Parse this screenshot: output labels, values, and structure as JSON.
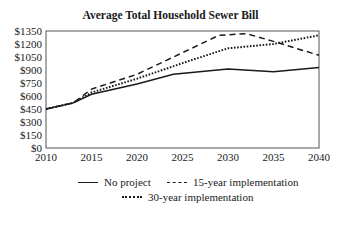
{
  "chart_data": {
    "type": "line",
    "title": "Average  Total Household Sewer Bill",
    "xlabel": "",
    "ylabel": "",
    "x_ticks": [
      "2010",
      "2015",
      "2020",
      "2025",
      "2030",
      "2035",
      "2040"
    ],
    "y_ticks": [
      "$0",
      "$150",
      "$300",
      "$450",
      "$600",
      "$750",
      "$900",
      "$1050",
      "$1200",
      "$1350"
    ],
    "xlim": [
      2010,
      2040
    ],
    "ylim": [
      0,
      1350
    ],
    "grid": false,
    "legend_position": "bottom",
    "series": [
      {
        "name": "No project",
        "style": "solid",
        "x": [
          2010,
          2013,
          2015,
          2020,
          2024,
          2030,
          2035,
          2040
        ],
        "values": [
          450,
          520,
          620,
          740,
          850,
          910,
          880,
          930
        ]
      },
      {
        "name": "15-year implementation",
        "style": "dashed",
        "x": [
          2010,
          2013,
          2015,
          2020,
          2025,
          2029,
          2032,
          2035,
          2040
        ],
        "values": [
          450,
          520,
          680,
          850,
          1100,
          1300,
          1320,
          1230,
          1070
        ]
      },
      {
        "name": "30-year implementation",
        "style": "dotted",
        "x": [
          2010,
          2013,
          2015,
          2020,
          2025,
          2030,
          2035,
          2040
        ],
        "values": [
          450,
          520,
          640,
          800,
          980,
          1150,
          1200,
          1300
        ]
      }
    ]
  },
  "legend": {
    "items": [
      "No project",
      "15-year implementation",
      "30-year implementation"
    ]
  }
}
